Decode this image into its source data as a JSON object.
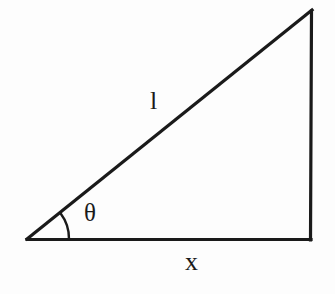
{
  "figure": {
    "type": "right-triangle-diagram",
    "background_color": "#fdfdfd",
    "stroke_color": "#1a1a1a"
  },
  "labels": {
    "hypotenuse": "l",
    "base": "x",
    "angle": "θ"
  },
  "icons": {
    "angle_arc": "angle-arc-icon"
  },
  "geometry": {
    "left_vertex": "27,240",
    "bottom_right_vertex": "310,240",
    "top_right_vertex": "312,10",
    "arc_radius": "42"
  }
}
